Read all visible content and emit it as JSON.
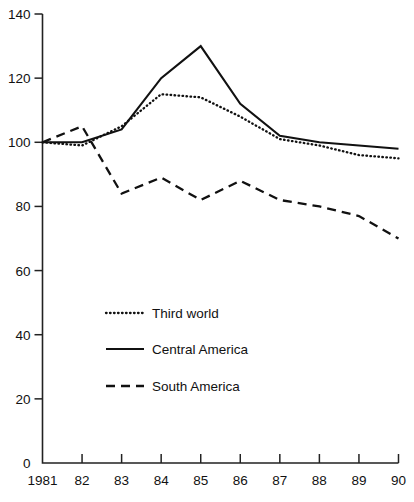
{
  "chart_data": {
    "type": "line",
    "title": "",
    "subtitle": "",
    "xlabel": "",
    "ylabel": "",
    "x": [
      1981,
      1982,
      1983,
      1984,
      1985,
      1986,
      1987,
      1988,
      1989,
      1990
    ],
    "x_tick_labels": [
      "1981",
      "82",
      "83",
      "84",
      "85",
      "86",
      "87",
      "88",
      "89",
      "90"
    ],
    "y_tick_labels": [
      "0",
      "20",
      "40",
      "60",
      "80",
      "100",
      "120",
      "140"
    ],
    "y_ticks": [
      0,
      20,
      40,
      60,
      80,
      100,
      120,
      140
    ],
    "ylim": [
      0,
      140
    ],
    "xlim": [
      1981,
      1990
    ],
    "grid": false,
    "legend_position": "center-left-lower",
    "series": [
      {
        "name": "Third world",
        "style": "dotted",
        "color": "#111111",
        "values": [
          100,
          99,
          105,
          115,
          114,
          108,
          101,
          99,
          96,
          95
        ]
      },
      {
        "name": "Central America",
        "style": "solid",
        "color": "#111111",
        "values": [
          100,
          100,
          104,
          120,
          130,
          112,
          102,
          100,
          99,
          98
        ]
      },
      {
        "name": "South America",
        "style": "dashed",
        "color": "#111111",
        "values": [
          100,
          105,
          84,
          89,
          82,
          88,
          82,
          80,
          77,
          70
        ]
      }
    ]
  },
  "legend": {
    "entries": [
      {
        "label": "Third world",
        "style": "dotted"
      },
      {
        "label": "Central America",
        "style": "solid"
      },
      {
        "label": "South America",
        "style": "dashed"
      }
    ]
  }
}
